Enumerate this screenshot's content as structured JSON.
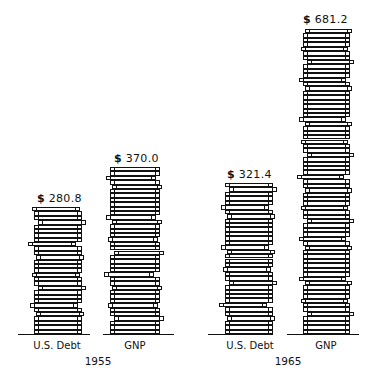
{
  "chart_data": {
    "type": "bar",
    "style": "pictograph-stacked-coins",
    "title": "",
    "xlabel": "",
    "ylabel": "",
    "groups": [
      "1955",
      "1965"
    ],
    "categories": [
      "U.S. Debt",
      "GNP"
    ],
    "series": [
      {
        "name": "1955",
        "values": [
          280.8,
          370.0
        ]
      },
      {
        "name": "1965",
        "values": [
          321.4,
          681.2
        ]
      }
    ],
    "units": "$ billions",
    "grid": false,
    "legend": "none"
  },
  "bars": [
    {
      "id": "debt-1955",
      "category": "U.S. Debt",
      "year": "1955",
      "value_label": "280.8",
      "currency": "$",
      "x": 34,
      "width": 48,
      "top": 207,
      "base_line": {
        "x": 18,
        "w": 72
      },
      "coins": 29,
      "label_x": 37,
      "label_y": 192
    },
    {
      "id": "gnp-1955",
      "category": "GNP",
      "year": "1955",
      "value_label": "370.0",
      "currency": "$",
      "x": 110,
      "width": 50,
      "top": 167,
      "base_line": {
        "x": 103,
        "w": 71
      },
      "coins": 38,
      "label_x": 114,
      "label_y": 152
    },
    {
      "id": "debt-1965",
      "category": "U.S. Debt",
      "year": "1965",
      "value_label": "321.4",
      "currency": "$",
      "x": 225,
      "width": 48,
      "top": 183,
      "base_line": {
        "x": 208,
        "w": 65
      },
      "coins": 34,
      "label_x": 227,
      "label_y": 168
    },
    {
      "id": "gnp-1965",
      "category": "GNP",
      "year": "1965",
      "value_label": "681.2",
      "currency": "$",
      "x": 303,
      "width": 47,
      "top": 29,
      "base_line": {
        "x": 287,
        "w": 72
      },
      "coins": 69,
      "label_x": 303,
      "label_y": 13
    }
  ],
  "category_labels": [
    {
      "text": "U.S. Debt",
      "x": 27,
      "y": 340,
      "w": 60
    },
    {
      "text": "GNP",
      "x": 115,
      "y": 340,
      "w": 40
    },
    {
      "text": "U.S. Debt",
      "x": 220,
      "y": 340,
      "w": 60
    },
    {
      "text": "GNP",
      "x": 306,
      "y": 340,
      "w": 40
    }
  ],
  "year_labels": [
    {
      "text": "1955",
      "x": 78,
      "y": 355,
      "w": 40
    },
    {
      "text": "1965",
      "x": 268,
      "y": 355,
      "w": 40
    }
  ],
  "baseline_y": 334,
  "coin_pitch": 4.4,
  "offset_pattern": [
    0,
    0,
    0,
    0,
    1,
    0,
    -2,
    0,
    0,
    0,
    2,
    0,
    0,
    -1,
    0,
    0,
    0,
    1,
    0,
    0,
    -3,
    0,
    0,
    0,
    0,
    2,
    0,
    0,
    -1,
    0,
    0,
    0,
    1,
    -2,
    0,
    0
  ]
}
